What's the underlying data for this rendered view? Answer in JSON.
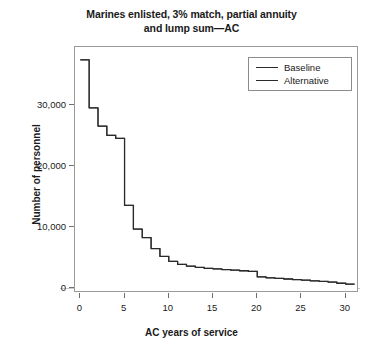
{
  "chart_data": {
    "type": "line",
    "title": "Marines enlisted, 3% match, partial annuity and lump sum—AC",
    "title_line1": "Marines enlisted, 3% match, partial annuity",
    "title_line2": "and lump sum—AC",
    "xlabel": "AC years of service",
    "ylabel": "Number of personnel",
    "xlim": [
      -0.6,
      31.5
    ],
    "ylim": [
      -900,
      39500
    ],
    "xticks": [
      0,
      5,
      10,
      15,
      20,
      25,
      30
    ],
    "xtick_labels": [
      "0",
      "5",
      "10",
      "15",
      "20",
      "25",
      "30"
    ],
    "yticks": [
      0,
      10000,
      20000,
      30000
    ],
    "ytick_labels": [
      "0",
      "10,000",
      "20,000",
      "30,000"
    ],
    "grid": false,
    "legend_position": "top-right",
    "drawstyle": "steps-post",
    "x": [
      0,
      1,
      2,
      3,
      4,
      5,
      6,
      7,
      8,
      9,
      10,
      11,
      12,
      13,
      14,
      15,
      16,
      17,
      18,
      19,
      20,
      21,
      22,
      23,
      24,
      25,
      26,
      27,
      28,
      29,
      30
    ],
    "series": [
      {
        "name": "Baseline",
        "color": "#2b2b2b",
        "values": [
          37400,
          29500,
          26500,
          25000,
          24500,
          13500,
          9600,
          8200,
          6400,
          5100,
          4300,
          3800,
          3500,
          3300,
          3150,
          3050,
          2950,
          2850,
          2750,
          2650,
          1750,
          1600,
          1500,
          1400,
          1300,
          1200,
          1100,
          1000,
          900,
          700,
          550
        ]
      },
      {
        "name": "Alternative",
        "color": "#2b2b2b",
        "values": [
          37400,
          29500,
          26500,
          25000,
          24500,
          13500,
          9600,
          8200,
          6400,
          5100,
          4300,
          3800,
          3500,
          3300,
          3150,
          3050,
          2950,
          2850,
          2750,
          2650,
          1750,
          1600,
          1500,
          1400,
          1300,
          1200,
          1100,
          1000,
          900,
          700,
          550
        ]
      }
    ]
  },
  "legend": {
    "items": [
      {
        "label": "Baseline"
      },
      {
        "label": "Alternative"
      }
    ]
  }
}
